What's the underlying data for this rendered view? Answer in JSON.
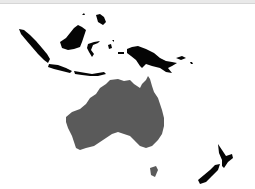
{
  "map": {
    "region": "Oceania / Maritime Southeast Asia",
    "highlighted_country": "Australia",
    "colors": {
      "highlighted": "#5a5a5a",
      "other_land": "#050505",
      "background": "#ffffff"
    },
    "shown_landmasses": [
      {
        "name": "Australia",
        "style": "highlighted"
      },
      {
        "name": "Tasmania",
        "style": "highlighted"
      },
      {
        "name": "Indonesia (Sumatra, Java, Sulawesi, islands)",
        "style": "other"
      },
      {
        "name": "Borneo",
        "style": "other"
      },
      {
        "name": "New Guinea",
        "style": "other"
      },
      {
        "name": "Philippines (partial)",
        "style": "other"
      },
      {
        "name": "New Zealand",
        "style": "other"
      }
    ]
  }
}
